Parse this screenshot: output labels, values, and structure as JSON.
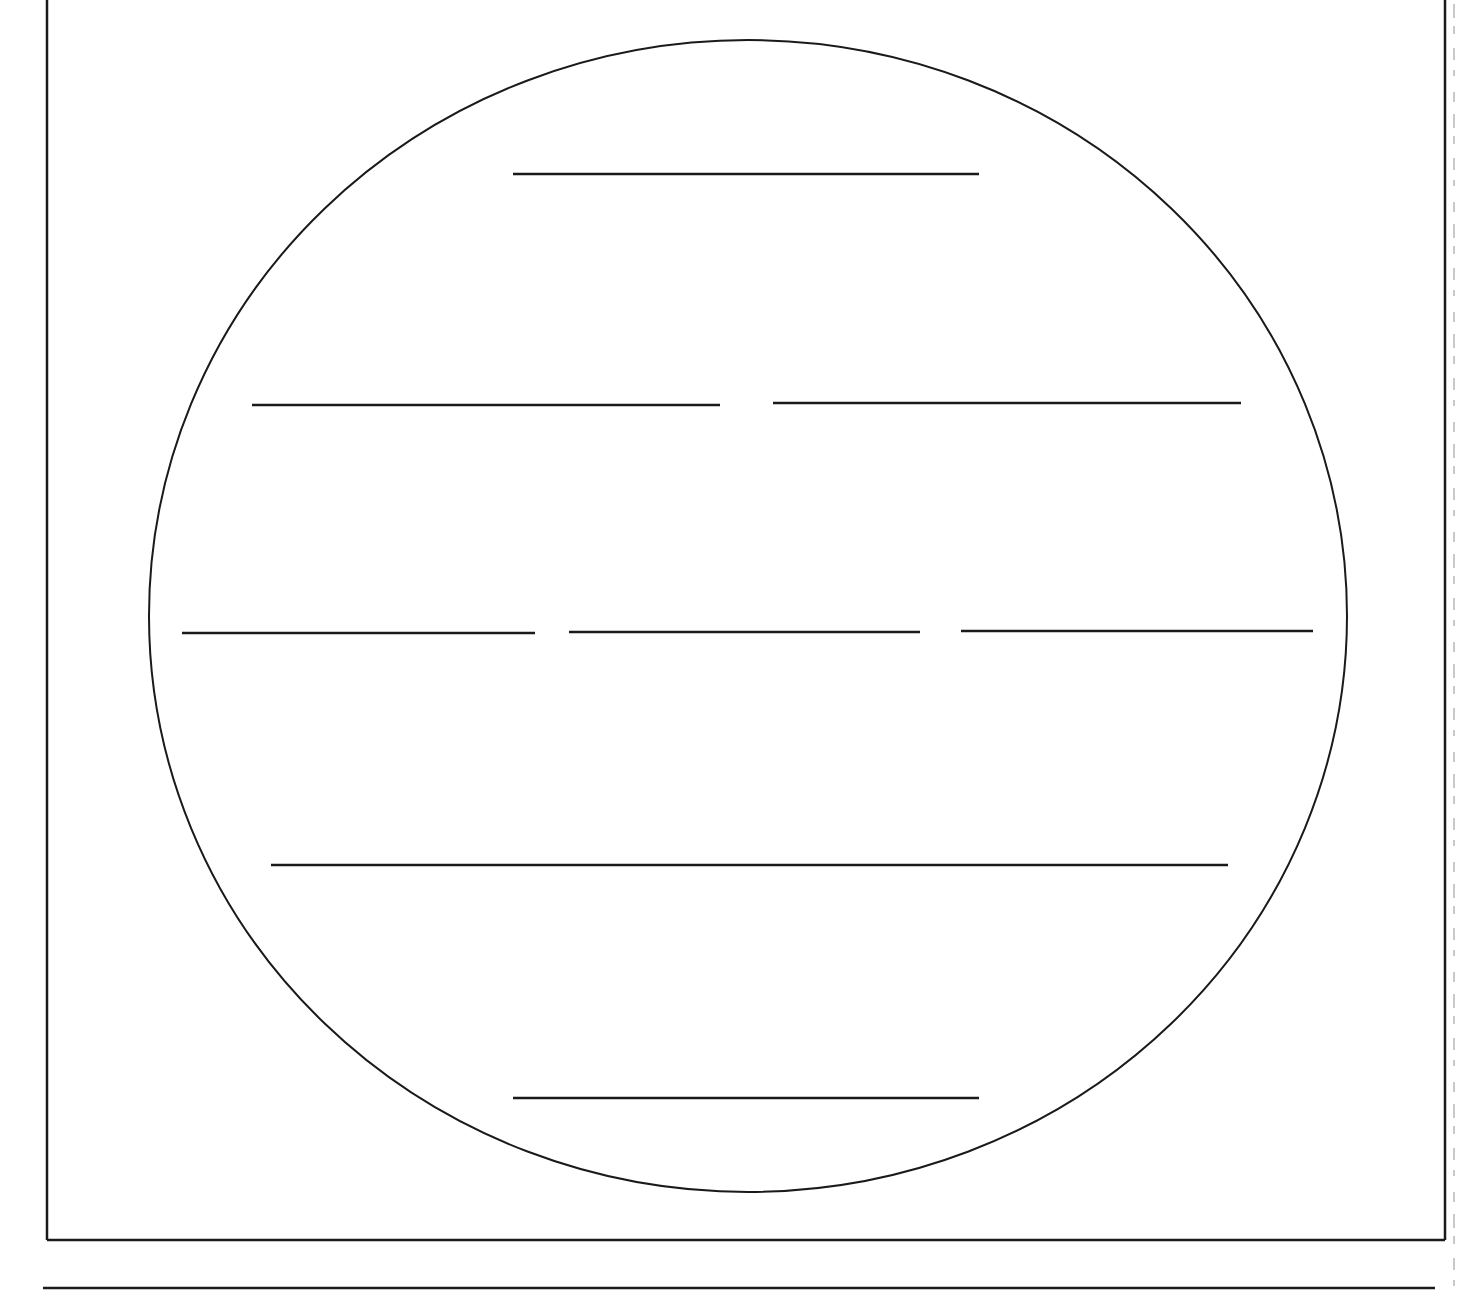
{
  "worksheet": {
    "type": "circle-map-graphic-organizer",
    "stroke_color": "#1a1a1a",
    "background_color": "#ffffff",
    "frame": {
      "left": 47,
      "right": 1445,
      "top": 0,
      "bottom": 1240,
      "has_top_border": false
    },
    "circle": {
      "cx": 748,
      "cy": 616,
      "rx": 599,
      "ry": 576
    },
    "answer_rows": [
      {
        "row": 1,
        "lines": [
          {
            "x1": 513,
            "x2": 979,
            "y": 174
          }
        ]
      },
      {
        "row": 2,
        "lines": [
          {
            "x1": 252,
            "x2": 720,
            "y": 405
          },
          {
            "x1": 773,
            "x2": 1241,
            "y": 403
          }
        ]
      },
      {
        "row": 3,
        "lines": [
          {
            "x1": 182,
            "x2": 535,
            "y": 633
          },
          {
            "x1": 569,
            "x2": 920,
            "y": 632
          },
          {
            "x1": 961,
            "x2": 1313,
            "y": 631
          }
        ]
      },
      {
        "row": 4,
        "lines": [
          {
            "x1": 271,
            "x2": 1228,
            "y": 865
          }
        ]
      },
      {
        "row": 5,
        "lines": [
          {
            "x1": 513,
            "x2": 979,
            "y": 1098
          }
        ]
      }
    ],
    "footer_line": {
      "x1": 43,
      "x2": 1435,
      "y": 1288
    },
    "bleed_through_column_x": 1453
  }
}
